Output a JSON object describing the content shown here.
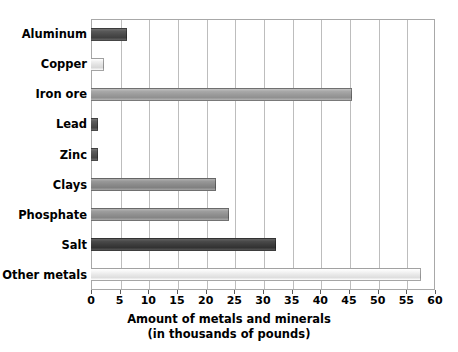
{
  "chart_data": {
    "type": "bar",
    "orientation": "horizontal",
    "title": "",
    "xlabel": "Amount of metals and minerals",
    "xlabel_line2": "(in thousands of pounds)",
    "ylabel": "",
    "xlim": [
      0,
      60
    ],
    "xticks": [
      0,
      5,
      10,
      15,
      20,
      25,
      30,
      35,
      40,
      45,
      50,
      55,
      60
    ],
    "xtick_labels": [
      "0",
      "5",
      "10",
      "15",
      "20",
      "25",
      "30",
      "35",
      "40",
      "45",
      "50",
      "55",
      "60"
    ],
    "grid": "vertical",
    "legend": "none",
    "categories": [
      "Aluminum",
      "Copper",
      "Iron ore",
      "Lead",
      "Zinc",
      "Clays",
      "Phosphate",
      "Salt",
      "Other metals"
    ],
    "values": [
      6.2,
      2.2,
      45.5,
      1.3,
      1.3,
      21.8,
      24.0,
      32.2,
      57.5
    ],
    "bar_colors": [
      "#4a4a4a",
      "#e2e2e2",
      "#9a9a9a",
      "#4f4f4f",
      "#4f4f4f",
      "#8a8a8a",
      "#8f8f8f",
      "#3c3c3c",
      "#e8e8e8"
    ],
    "bars": [
      {
        "label": "Aluminum",
        "value": 6.2,
        "color": "#4a4a4a"
      },
      {
        "label": "Copper",
        "value": 2.2,
        "color": "#e2e2e2"
      },
      {
        "label": "Iron ore",
        "value": 45.5,
        "color": "#9a9a9a"
      },
      {
        "label": "Lead",
        "value": 1.3,
        "color": "#4f4f4f"
      },
      {
        "label": "Zinc",
        "value": 1.3,
        "color": "#4f4f4f"
      },
      {
        "label": "Clays",
        "value": 21.8,
        "color": "#8a8a8a"
      },
      {
        "label": "Phosphate",
        "value": 24.0,
        "color": "#8f8f8f"
      },
      {
        "label": "Salt",
        "value": 32.2,
        "color": "#3c3c3c"
      },
      {
        "label": "Other metals",
        "value": 57.5,
        "color": "#e8e8e8"
      }
    ]
  },
  "style": {
    "background": "#ffffff",
    "gridline_color": "#bdbdbd",
    "frame_color": "#a8a8a8",
    "text_color": "#000000"
  }
}
